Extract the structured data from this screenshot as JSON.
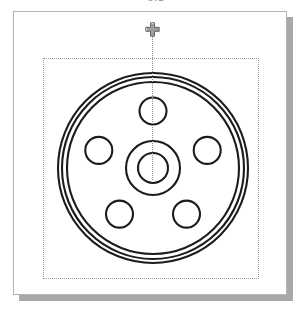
{
  "window": {
    "clipped_caption": "5.1",
    "background_color": "#ffffff",
    "panel_background": "#ffffff",
    "panel_border_color": "#b4b4b4",
    "shadow_color": "#a8a8a8"
  },
  "viewport": {
    "selection_rect_label": "selection-extents",
    "selection_rect_color": "#9b9b9b",
    "centerline_color": "#8d8d8d",
    "handle_label": "move-handle",
    "handle_color": "#7a7a7a"
  },
  "drawing": {
    "title": "Wheel Hub Flange",
    "stroke_color": "#1c1c1c",
    "fill_color": "none",
    "center": {
      "x": 139,
      "y": 156
    },
    "outer_rings": [
      {
        "name": "outer-rim-circle",
        "radius": 95
      },
      {
        "name": "mid-rim-circle",
        "radius": 91
      },
      {
        "name": "inner-rim-circle",
        "radius": 86
      }
    ],
    "hub": [
      {
        "name": "hub-outer-circle",
        "radius": 27
      },
      {
        "name": "hub-bore-circle",
        "radius": 15
      }
    ],
    "bolt_circle": {
      "name": "bolt-circle",
      "radius": 57,
      "hole_radius": 13.5,
      "count": 5,
      "start_angle_deg": -90,
      "holes": [
        {
          "name": "bolt-hole-top",
          "cx": 139,
          "cy": 99
        },
        {
          "name": "bolt-hole-right",
          "cx": 193,
          "cy": 138
        },
        {
          "name": "bolt-hole-bottom-right",
          "cx": 173,
          "cy": 202
        },
        {
          "name": "bolt-hole-bottom-left",
          "cx": 106,
          "cy": 202
        },
        {
          "name": "bolt-hole-left",
          "cx": 85,
          "cy": 138
        }
      ]
    }
  }
}
